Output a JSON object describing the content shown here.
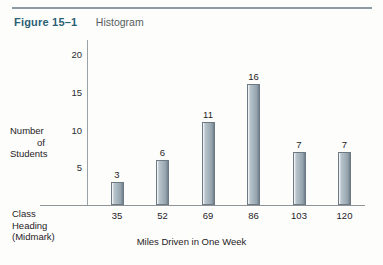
{
  "caption": {
    "figure_number": "Figure 15–1",
    "figure_title": "Histogram"
  },
  "labels": {
    "ylabel_line1": "Number",
    "ylabel_line2": "of",
    "ylabel_line3": "Students",
    "class_heading_line1": "Class",
    "class_heading_line2": "Heading",
    "class_heading_line3": "(Midmark)",
    "xtitle": "Miles Driven in One Week"
  },
  "colors": {
    "figure_number": "#2b5f74",
    "figure_title": "#585d60",
    "bar_fill": "#a9b6bf",
    "bar_edge": "#6d7a83",
    "axis": "#8d959b",
    "rule": "#8f9ba3"
  },
  "chart_data": {
    "type": "bar",
    "title": "Histogram",
    "xlabel": "Miles Driven in One Week",
    "ylabel": "Number of Students",
    "categories": [
      "35",
      "52",
      "69",
      "86",
      "103",
      "120"
    ],
    "values": [
      3,
      6,
      11,
      16,
      7,
      7
    ],
    "yticks": [
      5,
      10,
      15,
      20
    ],
    "ylim": [
      0,
      20
    ],
    "grid": false,
    "legend": null,
    "bar_labels": [
      "3",
      "6",
      "11",
      "16",
      "7",
      "7"
    ]
  }
}
